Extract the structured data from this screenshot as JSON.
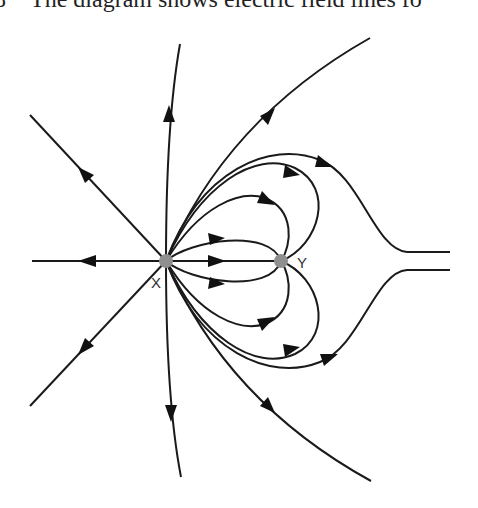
{
  "caption": {
    "number": "8",
    "text": "The diagram shows electric field lines fo"
  },
  "diagram": {
    "charges": [
      {
        "label": "X",
        "x": 166,
        "y": 261,
        "color": "#8f8f8f"
      },
      {
        "label": "Y",
        "x": 281,
        "y": 261,
        "color": "#8f8f8f"
      }
    ],
    "line_color": "#1a1a1a"
  }
}
